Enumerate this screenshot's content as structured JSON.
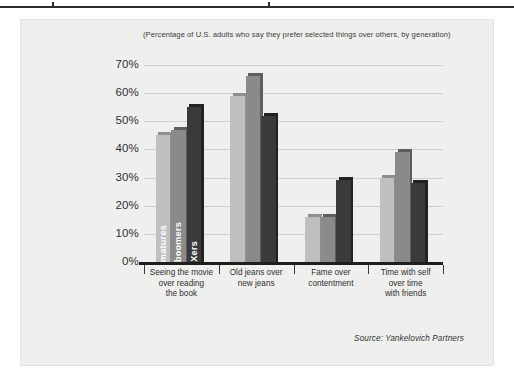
{
  "page": {
    "background": "#ffffff",
    "card_background": "#efefee"
  },
  "chart_data": {
    "type": "bar",
    "title": "(Percentage of U.S. adults who say they prefer selected things over others, by generation)",
    "xlabel": "",
    "ylabel": "",
    "ylim": [
      0,
      70
    ],
    "ytick_step": 10,
    "ytick_labels": [
      "0%",
      "10%",
      "20%",
      "30%",
      "40%",
      "50%",
      "60%",
      "70%"
    ],
    "ytick_values": [
      0,
      10,
      20,
      30,
      40,
      50,
      60,
      70
    ],
    "grid": true,
    "legend_position": "in-bar-vertical-labels",
    "categories": [
      "Seeing the movie over reading the book",
      "Old jeans over new jeans",
      "Fame over contentment",
      "Time with self over time with friends"
    ],
    "category_lines": [
      [
        "Seeing the movie",
        "over reading",
        "the book"
      ],
      [
        "Old jeans over",
        "new jeans"
      ],
      [
        "Fame over",
        "contentment"
      ],
      [
        "Time with self",
        "over time",
        "with friends"
      ]
    ],
    "series": [
      {
        "name": "matures",
        "color": "#bfbfbf",
        "values": [
          45,
          59,
          16,
          30
        ]
      },
      {
        "name": "boomers",
        "color": "#8a8a8a",
        "values": [
          47,
          66,
          16,
          39
        ]
      },
      {
        "name": "Xers",
        "color": "#3a3a3a",
        "values": [
          55,
          52,
          29,
          28
        ]
      }
    ],
    "annotations": [
      "Source: Yankelovich Partners"
    ],
    "source": "Source: Yankelovich Partners"
  }
}
